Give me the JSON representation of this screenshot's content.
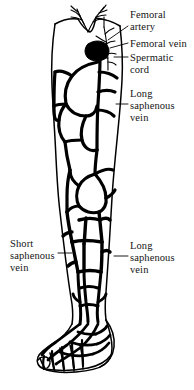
{
  "figure": {
    "ink_color": "#000000",
    "background_color": "#ffffff",
    "labels": [
      {
        "id": "femoral-artery",
        "text_lines": [
          "Femoral",
          "artery"
        ],
        "side": "right",
        "x": 130,
        "y": 9
      },
      {
        "id": "femoral-vein",
        "text_lines": [
          "Femoral vein"
        ],
        "side": "right",
        "x": 130,
        "y": 38
      },
      {
        "id": "spermatic-cord",
        "text_lines": [
          "Spermatic",
          "cord"
        ],
        "side": "right",
        "x": 130,
        "y": 52
      },
      {
        "id": "long-saphenous-upper",
        "text_lines": [
          "Long",
          "saphenous",
          "vein"
        ],
        "side": "right",
        "x": 130,
        "y": 88
      },
      {
        "id": "short-saphenous",
        "text_lines": [
          "Short",
          "saphenous",
          "vein"
        ],
        "side": "left",
        "x": 10,
        "y": 238
      },
      {
        "id": "long-saphenous-lower",
        "text_lines": [
          "Long",
          "saphenous",
          "vein"
        ],
        "side": "right",
        "x": 130,
        "y": 240
      }
    ]
  }
}
